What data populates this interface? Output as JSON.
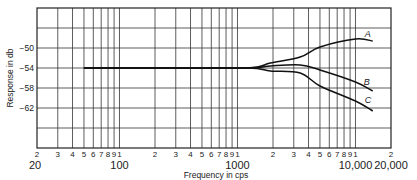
{
  "chart_data": {
    "type": "line",
    "title": "",
    "xlabel": "Frequency in cps",
    "ylabel": "Response in db",
    "x_scale": "log",
    "xlim": [
      20,
      20000
    ],
    "ylim": [
      -70,
      -42
    ],
    "grid": true,
    "y_ticks": [
      -50,
      -54,
      -58,
      -62
    ],
    "x_major_labels": [
      {
        "value": 20,
        "label": "20"
      },
      {
        "value": 100,
        "label": "100"
      },
      {
        "value": 1000,
        "label": "1000"
      },
      {
        "value": 10000,
        "label": "10,000"
      },
      {
        "value": 20000,
        "label": "20,000"
      }
    ],
    "x_minor_labels": [
      "2",
      "3",
      "4",
      "5",
      "6",
      "7",
      "8",
      "9",
      "1",
      "2",
      "3",
      "4",
      "5",
      "6",
      "7",
      "8",
      "9",
      "1",
      "2",
      "3",
      "4",
      "5",
      "6",
      "7",
      "8",
      "9",
      "1",
      "2"
    ],
    "series": [
      {
        "name": "A",
        "x": [
          50,
          200,
          1200,
          1900,
          3400,
          5000,
          10000,
          14000
        ],
        "y": [
          -54,
          -54,
          -54,
          -53,
          -51.8,
          -49.8,
          -48.2,
          -48.6
        ]
      },
      {
        "name": "B",
        "x": [
          50,
          200,
          1200,
          1900,
          3400,
          5000,
          10000,
          14000
        ],
        "y": [
          -54,
          -54,
          -54,
          -53.6,
          -53.4,
          -54.4,
          -56.8,
          -58.6
        ]
      },
      {
        "name": "C",
        "x": [
          50,
          200,
          1200,
          1900,
          3400,
          5000,
          10000,
          14000
        ],
        "y": [
          -54,
          -54,
          -54,
          -54.6,
          -55,
          -57.6,
          -60.6,
          -62.6
        ]
      }
    ],
    "legend": "inline labels at curve ends (A, B, C)"
  }
}
